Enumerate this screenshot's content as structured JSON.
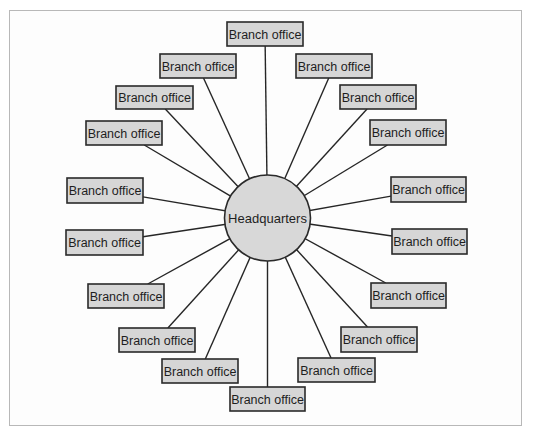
{
  "diagram": {
    "type": "hub-and-spoke",
    "hub": {
      "label": "Headquarters"
    },
    "branches": [
      {
        "label": "Branch office",
        "position": "top"
      },
      {
        "label": "Branch office",
        "position": "upper-right-1"
      },
      {
        "label": "Branch office",
        "position": "upper-right-2"
      },
      {
        "label": "Branch office",
        "position": "upper-right-3"
      },
      {
        "label": "Branch office",
        "position": "right-upper"
      },
      {
        "label": "Branch office",
        "position": "right-lower"
      },
      {
        "label": "Branch office",
        "position": "lower-right-3"
      },
      {
        "label": "Branch office",
        "position": "lower-right-2"
      },
      {
        "label": "Branch office",
        "position": "lower-right-1"
      },
      {
        "label": "Branch office",
        "position": "bottom"
      },
      {
        "label": "Branch office",
        "position": "lower-left-1"
      },
      {
        "label": "Branch office",
        "position": "lower-left-2"
      },
      {
        "label": "Branch office",
        "position": "lower-left-3"
      },
      {
        "label": "Branch office",
        "position": "left-lower"
      },
      {
        "label": "Branch office",
        "position": "left-upper"
      },
      {
        "label": "Branch office",
        "position": "upper-left-3"
      },
      {
        "label": "Branch office",
        "position": "upper-left-2"
      },
      {
        "label": "Branch office",
        "position": "upper-left-1"
      }
    ],
    "colors": {
      "box_fill": "#d6d6d6",
      "hub_fill": "#d8d8d8",
      "line": "#262626"
    }
  }
}
